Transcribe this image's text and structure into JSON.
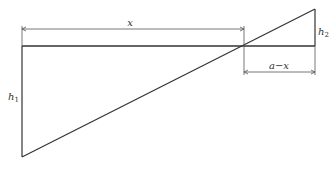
{
  "diagram": {
    "labels": {
      "x": "x",
      "a_minus_x": "a−x",
      "h1": "h",
      "h1_sub": "1",
      "h2": "h",
      "h2_sub": "2"
    },
    "colors": {
      "line": "#333333",
      "dim": "#555555"
    }
  }
}
